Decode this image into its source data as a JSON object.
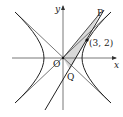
{
  "diagram": {
    "type": "hyperbola with asymptotes and tangent line",
    "labels": {
      "y_axis": "y",
      "x_axis": "x",
      "origin": "O",
      "point_p": "P",
      "point_q": "Q",
      "given_point": "(3, 2)"
    },
    "colors": {
      "stroke": "#333333",
      "shade": "#d9d9d9",
      "background": "#ffffff"
    }
  }
}
